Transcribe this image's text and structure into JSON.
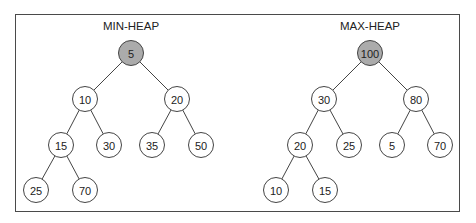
{
  "diagram": {
    "type": "binary-heap-comparison",
    "colors": {
      "root_fill": "#ababab",
      "node_fill": "#ffffff",
      "stroke": "#444444",
      "border": "#4a4a4a"
    },
    "heaps": [
      {
        "title": "MIN-HEAP",
        "title_pos": [
          131,
          26
        ],
        "nodes": [
          {
            "id": "n0",
            "label": "5",
            "x": 131,
            "y": 53,
            "root": true
          },
          {
            "id": "n1",
            "label": "10",
            "x": 85,
            "y": 99
          },
          {
            "id": "n2",
            "label": "20",
            "x": 177,
            "y": 99
          },
          {
            "id": "n3",
            "label": "15",
            "x": 61,
            "y": 145
          },
          {
            "id": "n4",
            "label": "30",
            "x": 109,
            "y": 145
          },
          {
            "id": "n5",
            "label": "35",
            "x": 152,
            "y": 145
          },
          {
            "id": "n6",
            "label": "50",
            "x": 201,
            "y": 145
          },
          {
            "id": "n7",
            "label": "25",
            "x": 36,
            "y": 190
          },
          {
            "id": "n8",
            "label": "70",
            "x": 85,
            "y": 190
          }
        ],
        "edges": [
          [
            "n0",
            "n1"
          ],
          [
            "n0",
            "n2"
          ],
          [
            "n1",
            "n3"
          ],
          [
            "n1",
            "n4"
          ],
          [
            "n2",
            "n5"
          ],
          [
            "n2",
            "n6"
          ],
          [
            "n3",
            "n7"
          ],
          [
            "n3",
            "n8"
          ]
        ]
      },
      {
        "title": "MAX-HEAP",
        "title_pos": [
          370,
          26
        ],
        "nodes": [
          {
            "id": "m0",
            "label": "100",
            "x": 370,
            "y": 53,
            "root": true
          },
          {
            "id": "m1",
            "label": "30",
            "x": 324,
            "y": 99
          },
          {
            "id": "m2",
            "label": "80",
            "x": 416,
            "y": 99
          },
          {
            "id": "m3",
            "label": "20",
            "x": 300,
            "y": 145
          },
          {
            "id": "m4",
            "label": "25",
            "x": 349,
            "y": 145
          },
          {
            "id": "m5",
            "label": "5",
            "x": 392,
            "y": 145
          },
          {
            "id": "m6",
            "label": "70",
            "x": 440,
            "y": 145
          },
          {
            "id": "m7",
            "label": "10",
            "x": 276,
            "y": 190
          },
          {
            "id": "m8",
            "label": "15",
            "x": 325,
            "y": 190
          }
        ],
        "edges": [
          [
            "m0",
            "m1"
          ],
          [
            "m0",
            "m2"
          ],
          [
            "m1",
            "m3"
          ],
          [
            "m1",
            "m4"
          ],
          [
            "m2",
            "m5"
          ],
          [
            "m2",
            "m6"
          ],
          [
            "m3",
            "m7"
          ],
          [
            "m3",
            "m8"
          ]
        ]
      }
    ]
  }
}
